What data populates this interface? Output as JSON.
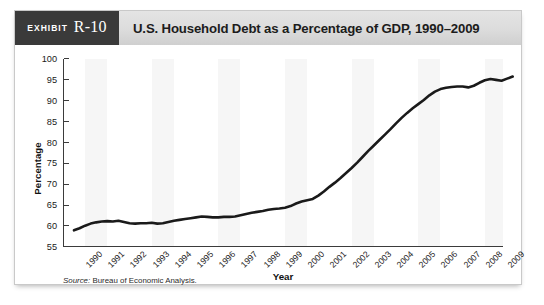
{
  "exhibit": {
    "word": "Exhibit",
    "number": "R-10"
  },
  "header": {
    "title": "U.S. Household Debt as a Percentage of GDP, 1990–2009"
  },
  "source": {
    "label": "Source:",
    "text": "Bureau of Economic Analysis."
  },
  "colors": {
    "badge_background": "#3a3a3a",
    "header_background": "#dcdcdc",
    "line": "#1a1a1a",
    "axis": "#3b3b3b",
    "band": "#f6f6f6",
    "card_border": "#c9c9c9"
  },
  "chart_data": {
    "type": "line",
    "title": "U.S. Household Debt as a Percentage of GDP, 1990–2009",
    "xlabel": "Year",
    "ylabel": "Percentage",
    "ylim": [
      55,
      100
    ],
    "ytick_step": 5,
    "yticks": [
      100,
      95,
      90,
      85,
      80,
      75,
      70,
      65,
      60,
      55
    ],
    "grid": false,
    "legend": null,
    "categories": [
      "1990",
      "1991",
      "1992",
      "1993",
      "1994",
      "1995",
      "1996",
      "1997",
      "1998",
      "1999",
      "2000",
      "2001",
      "2002",
      "2003",
      "2004",
      "2005",
      "2006",
      "2007",
      "2008",
      "2009"
    ],
    "x": [
      1990,
      1991,
      1992,
      1993,
      1994,
      1995,
      1996,
      1997,
      1998,
      1999,
      2000,
      2001,
      2002,
      2003,
      2004,
      2005,
      2006,
      2007,
      2008,
      2009
    ],
    "values": [
      59.2,
      60.8,
      61.2,
      60.7,
      60.8,
      61.6,
      62.2,
      62.2,
      63.2,
      64.2,
      66.0,
      69.5,
      73.5,
      78.5,
      84.0,
      88.5,
      92.5,
      93.5,
      94.6,
      95.8
    ],
    "quarterly_x": [
      1990.0,
      1990.25,
      1990.5,
      1990.75,
      1991.0,
      1991.25,
      1991.5,
      1991.75,
      1992.0,
      1992.25,
      1992.5,
      1992.75,
      1993.0,
      1993.25,
      1993.5,
      1993.75,
      1994.0,
      1994.25,
      1994.5,
      1994.75,
      1995.0,
      1995.25,
      1995.5,
      1995.75,
      1996.0,
      1996.25,
      1996.5,
      1996.75,
      1997.0,
      1997.25,
      1997.5,
      1997.75,
      1998.0,
      1998.25,
      1998.5,
      1998.75,
      1999.0,
      1999.25,
      1999.5,
      1999.75,
      2000.0,
      2000.25,
      2000.5,
      2000.75,
      2001.0,
      2001.25,
      2001.5,
      2001.75,
      2002.0,
      2002.25,
      2002.5,
      2002.75,
      2003.0,
      2003.25,
      2003.5,
      2003.75,
      2004.0,
      2004.25,
      2004.5,
      2004.75,
      2005.0,
      2005.25,
      2005.5,
      2005.75,
      2006.0,
      2006.25,
      2006.5,
      2006.75,
      2007.0,
      2007.25,
      2007.5,
      2007.75,
      2008.0,
      2008.25,
      2008.5,
      2008.75,
      2009.0,
      2009.25,
      2009.5,
      2009.75
    ],
    "quarterly_values": [
      59.0,
      59.5,
      60.1,
      60.6,
      60.9,
      61.1,
      61.2,
      61.1,
      61.3,
      61.0,
      60.7,
      60.6,
      60.7,
      60.7,
      60.8,
      60.6,
      60.7,
      61.0,
      61.3,
      61.5,
      61.7,
      61.9,
      62.1,
      62.3,
      62.2,
      62.1,
      62.1,
      62.2,
      62.2,
      62.3,
      62.6,
      62.9,
      63.2,
      63.4,
      63.6,
      63.9,
      64.1,
      64.2,
      64.4,
      64.8,
      65.4,
      65.9,
      66.2,
      66.5,
      67.3,
      68.3,
      69.4,
      70.4,
      71.5,
      72.7,
      73.9,
      75.2,
      76.6,
      78.0,
      79.3,
      80.6,
      81.9,
      83.2,
      84.6,
      85.9,
      87.1,
      88.2,
      89.2,
      90.2,
      91.3,
      92.2,
      92.8,
      93.1,
      93.3,
      93.4,
      93.4,
      93.2,
      93.6,
      94.3,
      94.9,
      95.2,
      95.0,
      94.8,
      95.3,
      95.8
    ]
  }
}
